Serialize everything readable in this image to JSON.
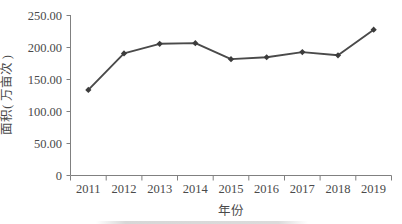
{
  "chart_data": {
    "type": "line",
    "title": "",
    "xlabel": "年份",
    "ylabel": "面积( 万亩次 )",
    "categories": [
      "2011",
      "2012",
      "2013",
      "2014",
      "2015",
      "2016",
      "2017",
      "2018",
      "2019"
    ],
    "series": [
      {
        "name": "面积",
        "values": [
          133,
          190,
          205,
          206,
          181,
          184,
          192,
          187,
          227
        ]
      }
    ],
    "x": [
      2011,
      2012,
      2013,
      2014,
      2015,
      2016,
      2017,
      2018,
      2019
    ],
    "ylim": [
      0,
      250
    ],
    "ytick_values": [
      0,
      50,
      100,
      150,
      200,
      250
    ],
    "ytick_labels": [
      "0",
      "50.00",
      "100.00",
      "150.00",
      "200.00",
      "250.00"
    ],
    "xtick_labels": [
      "2011",
      "2012",
      "2013",
      "2014",
      "2015",
      "2016",
      "2017",
      "2018",
      "2019"
    ],
    "grid": false,
    "legend": false,
    "legend_position": "none",
    "marker": "diamond",
    "line_color": "#4a4a4a",
    "marker_color": "#3c3c3c",
    "axis_color": "#808080",
    "background_color": "#ffffff"
  }
}
